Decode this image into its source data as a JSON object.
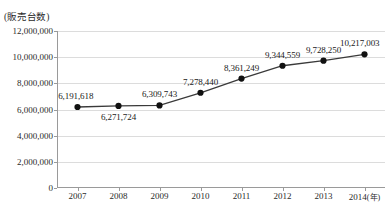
{
  "chart_data": {
    "type": "line",
    "title": "",
    "xlabel": "(年)",
    "ylabel": "(販売台数)",
    "categories": [
      "2007",
      "2008",
      "2009",
      "2010",
      "2011",
      "2012",
      "2013",
      "2014"
    ],
    "values": [
      6191618,
      6271724,
      6309743,
      7278440,
      8361249,
      9344559,
      9728250,
      10217003
    ],
    "value_labels": [
      "6,191,618",
      "6,271,724",
      "6,309,743",
      "7,278,440",
      "8,361,249",
      "9,344,559",
      "9,728,250",
      "10,217,003"
    ],
    "label_positions": [
      "above",
      "below",
      "above",
      "above",
      "above",
      "above",
      "above",
      "above"
    ],
    "ylim": [
      0,
      12000000
    ],
    "ytick_values": [
      0,
      2000000,
      4000000,
      6000000,
      8000000,
      10000000,
      12000000
    ],
    "ytick_labels": [
      "0",
      "2,000,000",
      "4,000,000",
      "6,000,000",
      "8,000,000",
      "10,000,000",
      "12,000,000"
    ],
    "grid": "horizontal",
    "legend": "none",
    "series_color": "#3a3a3a",
    "marker_color": "#111111",
    "grid_color": "#dcdcdc",
    "axis_color": "#9a9a9a"
  },
  "axis": {
    "y_unit_caption": "(販売台数)",
    "x_unit_suffix": "(年)"
  }
}
